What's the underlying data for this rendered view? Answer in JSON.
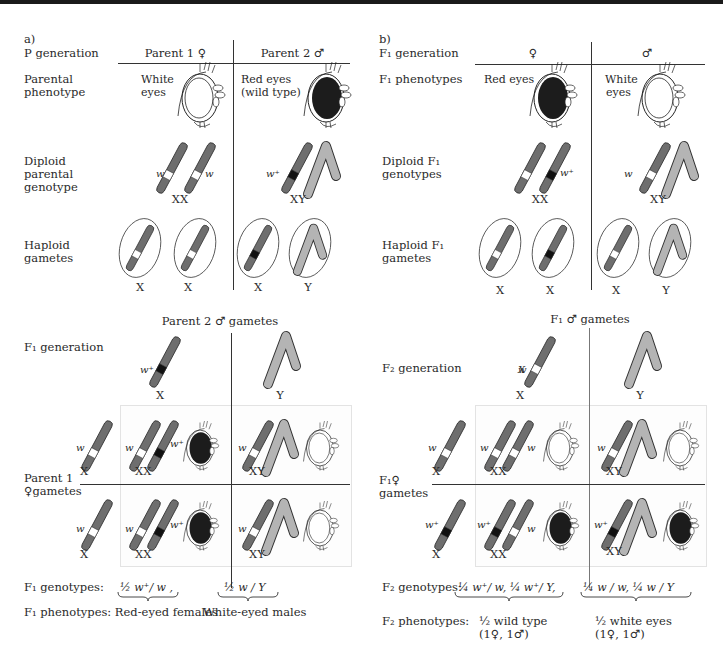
{
  "panel_a": {
    "label": "a)",
    "p_generation_label": "P generation",
    "parent1_header": "Parent 1 ♀",
    "parent2_header": "Parent 2 ♂",
    "parental_phenotype_label_1": "Parental",
    "parental_phenotype_label_2": "phenotype",
    "parent1_phenotype_1": "White",
    "parent1_phenotype_2": "eyes",
    "parent2_phenotype_1": "Red eyes",
    "parent2_phenotype_2": "(wild type)",
    "diploid_label_1": "Diploid",
    "diploid_label_2": "parental",
    "diploid_label_3": "genotype",
    "parent1_genotype": "XX",
    "parent2_genotype": "XY",
    "haploid_label_1": "Haploid",
    "haploid_label_2": "gametes",
    "gametes": [
      "X",
      "X",
      "X",
      "Y"
    ],
    "allele_w": "w",
    "allele_wplus": "w⁺",
    "punnett_header": "Parent 2 ♂ gametes",
    "f1_generation_label": "F₁ generation",
    "male_gametes": [
      "X",
      "Y"
    ],
    "female_gametes_label_1": "Parent 1",
    "female_gametes_label_2": "♀gametes",
    "female_gametes": [
      "X",
      "X"
    ],
    "cells": [
      [
        "XX",
        "XY"
      ],
      [
        "XX",
        "XY"
      ]
    ],
    "f1_genotypes_label": "F₁ genotypes:",
    "f1_genotype_1": "½  w⁺/ w ,",
    "f1_genotype_2": "½  w / Y",
    "f1_phenotypes_label": "F₁ phenotypes: Red-eyed females",
    "f1_phenotype_2": "White-eyed males"
  },
  "panel_b": {
    "label": "b)",
    "f1_generation_label": "F₁ generation",
    "female_header": "♀",
    "male_header": "♂",
    "f1_phenotypes_label": "F₁ phenotypes",
    "female_phenotype": "Red eyes",
    "male_phenotype_1": "White",
    "male_phenotype_2": "eyes",
    "diploid_label_1": "Diploid F₁",
    "diploid_label_2": "genotypes",
    "female_genotype": "XX",
    "male_genotype": "XY",
    "haploid_label_1": "Haploid F₁",
    "haploid_label_2": "gametes",
    "gametes": [
      "X",
      "X",
      "X",
      "Y"
    ],
    "punnett_header": "F₁ ♂ gametes",
    "f2_generation_label": "F₂ generation",
    "male_gametes": [
      "X",
      "Y"
    ],
    "female_gametes_label_1": "F₁♀",
    "female_gametes_label_2": "gametes",
    "female_gametes": [
      "X",
      "X"
    ],
    "cells": [
      [
        "XX",
        "XY"
      ],
      [
        "XX",
        "XY"
      ]
    ],
    "f2_genotypes_label": "F₂ genotypes:",
    "f2_genotype_1": "¼ w⁺/ w,  ¼ w⁺/ Y,",
    "f2_genotype_2": "¼ w / w,  ¼ w / Y",
    "f2_phenotypes_label": "F₂ phenotypes:",
    "f2_phenotype_1a": "½ wild type",
    "f2_phenotype_1b": "(1♀, 1♂)",
    "f2_phenotype_2a": "½ white eyes",
    "f2_phenotype_2b": "(1♀, 1♂)"
  },
  "colors": {
    "chromosome_x": "#6e6e6e",
    "chromosome_y": "#b4b4b4",
    "white_allele_band": "#ffffff",
    "wild_allele_band": "#111111",
    "red_eye": "#1c1c1c",
    "line": "#333333"
  }
}
